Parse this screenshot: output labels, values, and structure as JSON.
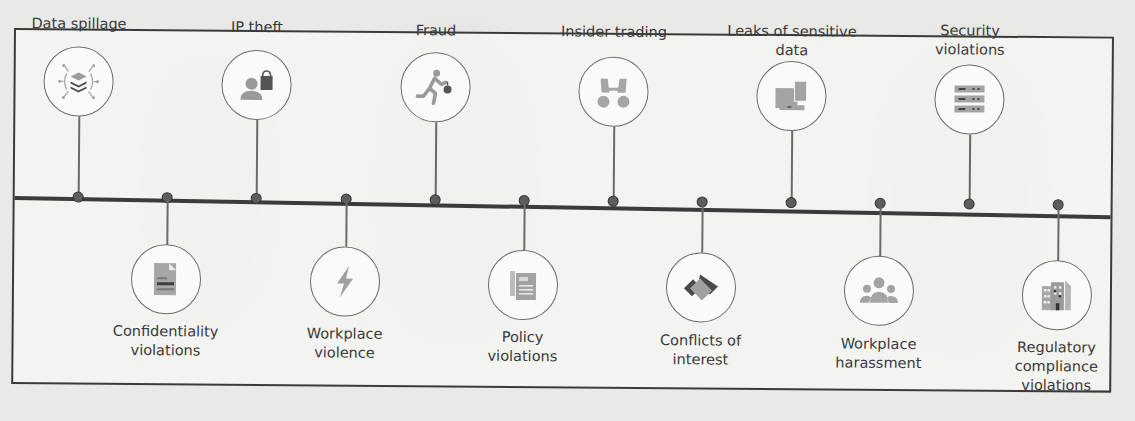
{
  "diagram": {
    "type": "timeline",
    "line_color": "#3b3b3b",
    "icon_color": "#9a9a9a",
    "items_top": [
      {
        "label": "Data spillage",
        "icon": "data-spillage-icon"
      },
      {
        "label": "IP theft",
        "icon": "ip-theft-icon"
      },
      {
        "label": "Fraud",
        "icon": "fraud-icon"
      },
      {
        "label": "Insider trading",
        "icon": "insider-trading-icon"
      },
      {
        "label": "Leaks of sensitive\ndata",
        "icon": "sensitive-data-leak-icon"
      },
      {
        "label": "Security\nviolations",
        "icon": "security-violations-icon"
      }
    ],
    "items_bottom": [
      {
        "label": "Confidentiality\nviolations",
        "icon": "confidentiality-icon"
      },
      {
        "label": "Workplace\nviolence",
        "icon": "workplace-violence-icon"
      },
      {
        "label": "Policy\nviolations",
        "icon": "policy-violations-icon"
      },
      {
        "label": "Conflicts of\ninterest",
        "icon": "conflicts-of-interest-icon"
      },
      {
        "label": "Workplace\nharassment",
        "icon": "workplace-harassment-icon"
      },
      {
        "label": "Regulatory\ncompliance\nviolations",
        "icon": "regulatory-compliance-icon"
      }
    ]
  }
}
